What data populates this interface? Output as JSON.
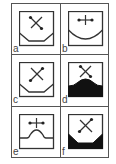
{
  "figure": {
    "panels": [
      {
        "label": "a",
        "shape": "trapezoid-floor",
        "fill": "none",
        "marker": "diagonal-cross"
      },
      {
        "label": "b",
        "shape": "concave-arc-floor",
        "fill": "none",
        "marker": "horizontal-cross"
      },
      {
        "label": "c",
        "shape": "trapezoid-floor",
        "fill": "none",
        "marker": "diagonal-cross"
      },
      {
        "label": "d",
        "shape": "convex-mound-floor",
        "fill": "#111111",
        "marker": "diagonal-cross"
      },
      {
        "label": "e",
        "shape": "convex-mound-floor",
        "fill": "none",
        "marker": "horizontal-cross"
      },
      {
        "label": "f",
        "shape": "trapezoid-floor",
        "fill": "#111111",
        "marker": "diagonal-cross"
      }
    ]
  },
  "colors": {
    "line": "#333333",
    "fill": "#111111",
    "grid": "#555555"
  }
}
